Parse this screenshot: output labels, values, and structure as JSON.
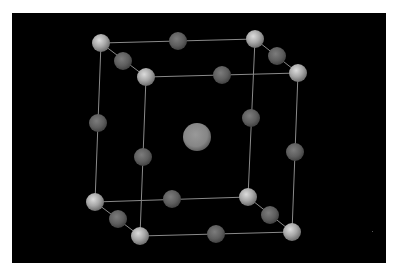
{
  "figure": {
    "type": "crystal-structure-rendering",
    "background_color": "#000000",
    "page_color": "#ffffff",
    "bond_color": "#8a8a8a",
    "corner_atom_color": "#bdbdbd",
    "edge_atom_color": "#6b6b6b",
    "center_atom_color": "#8c8c8c"
  },
  "atoms": {
    "corners": [
      {
        "id": "back-top-left",
        "x": 101,
        "y": 43,
        "r": 9
      },
      {
        "id": "back-top-right",
        "x": 255,
        "y": 39,
        "r": 9
      },
      {
        "id": "back-bottom-left",
        "x": 95,
        "y": 202,
        "r": 9
      },
      {
        "id": "back-bottom-right",
        "x": 248,
        "y": 197,
        "r": 9
      },
      {
        "id": "front-top-left",
        "x": 146,
        "y": 77,
        "r": 9
      },
      {
        "id": "front-top-right",
        "x": 298,
        "y": 73,
        "r": 9
      },
      {
        "id": "front-bottom-left",
        "x": 140,
        "y": 236,
        "r": 9
      },
      {
        "id": "front-bottom-right",
        "x": 292,
        "y": 232,
        "r": 9
      }
    ],
    "edges": [
      {
        "id": "back-top",
        "x": 178,
        "y": 41,
        "r": 9
      },
      {
        "id": "top-left-depth",
        "x": 123,
        "y": 61,
        "r": 9
      },
      {
        "id": "top-right-depth",
        "x": 277,
        "y": 56,
        "r": 9
      },
      {
        "id": "front-top",
        "x": 222,
        "y": 75,
        "r": 9
      },
      {
        "id": "back-left",
        "x": 98,
        "y": 123,
        "r": 9
      },
      {
        "id": "back-right",
        "x": 251,
        "y": 118,
        "r": 9
      },
      {
        "id": "front-left",
        "x": 143,
        "y": 157,
        "r": 9
      },
      {
        "id": "front-right",
        "x": 295,
        "y": 152,
        "r": 9
      },
      {
        "id": "back-bottom",
        "x": 172,
        "y": 199,
        "r": 9
      },
      {
        "id": "bottom-left-depth",
        "x": 118,
        "y": 219,
        "r": 9
      },
      {
        "id": "bottom-right-depth",
        "x": 270,
        "y": 215,
        "r": 9
      },
      {
        "id": "front-bottom",
        "x": 216,
        "y": 234,
        "r": 9
      }
    ],
    "center": {
      "id": "body-center",
      "x": 197,
      "y": 137,
      "r": 14
    }
  },
  "bonds": [
    [
      "back-top-left",
      "back-top-right"
    ],
    [
      "back-top-left",
      "back-bottom-left"
    ],
    [
      "back-top-right",
      "back-bottom-right"
    ],
    [
      "back-bottom-left",
      "back-bottom-right"
    ],
    [
      "front-top-left",
      "front-top-right"
    ],
    [
      "front-top-left",
      "front-bottom-left"
    ],
    [
      "front-top-right",
      "front-bottom-right"
    ],
    [
      "front-bottom-left",
      "front-bottom-right"
    ],
    [
      "back-top-left",
      "front-top-left"
    ],
    [
      "back-top-right",
      "front-top-right"
    ],
    [
      "back-bottom-left",
      "front-bottom-left"
    ],
    [
      "back-bottom-right",
      "front-bottom-right"
    ]
  ]
}
